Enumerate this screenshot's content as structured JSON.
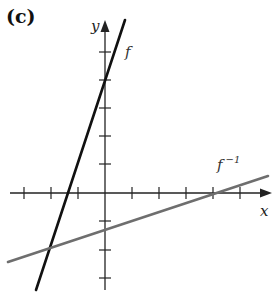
{
  "panel_label": "(c)",
  "axes": {
    "x_label": "x",
    "y_label": "y",
    "origin_px": [
      105,
      193
    ],
    "x_tick_px": [
      24,
      51,
      78,
      132,
      159,
      186,
      213,
      240
    ],
    "y_tick_px": [
      52,
      80,
      108,
      136,
      164,
      221,
      250,
      278
    ],
    "x_axis_px": [
      10,
      272
    ],
    "y_axis_px": [
      20,
      290
    ]
  },
  "functions": [
    {
      "name": "f",
      "label": "f",
      "sup": "",
      "color": "#111111",
      "from_px": [
        36,
        290
      ],
      "to_px": [
        125,
        20
      ],
      "label_px": [
        125,
        57
      ]
    },
    {
      "name": "f_inverse",
      "label": "f",
      "sup": "−1",
      "color": "#6e6e6e",
      "from_px": [
        8,
        262
      ],
      "to_px": [
        268,
        176
      ],
      "label_px": [
        217,
        170
      ]
    }
  ]
}
